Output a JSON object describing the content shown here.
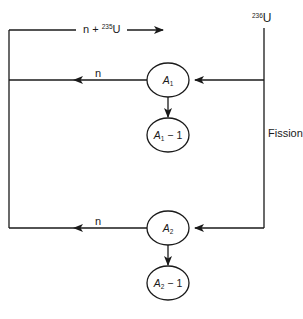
{
  "diagram": {
    "type": "fission-flow",
    "colors": {
      "line": "#1a1a1a",
      "background": "#ffffff"
    },
    "top_flow": {
      "label_prefix": "n + ",
      "label_mass": "235",
      "label_element": "U"
    },
    "compound_nucleus": {
      "mass": "236",
      "element": "U"
    },
    "process_label": "Fission",
    "branches": [
      {
        "neutron_label": "n",
        "fragment": {
          "symbol": "A",
          "index": "1"
        },
        "daughter": {
          "symbol": "A",
          "index": "1",
          "suffix": " − 1"
        }
      },
      {
        "neutron_label": "n",
        "fragment": {
          "symbol": "A",
          "index": "2"
        },
        "daughter": {
          "symbol": "A",
          "index": "2",
          "suffix": " − 1"
        }
      }
    ]
  }
}
